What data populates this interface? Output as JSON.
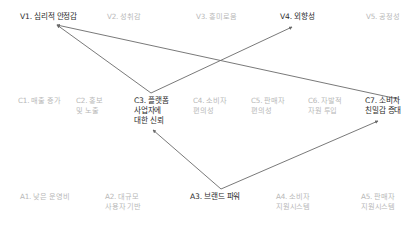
{
  "diagram": {
    "type": "means-end-ladder",
    "colors": {
      "active_text": "#2a2a2a",
      "inactive_text": "#b8b8b8",
      "edge": "#6a6a6a"
    },
    "values": [
      {
        "id": "V1",
        "label": "V1. 심리적 안정감",
        "active": true
      },
      {
        "id": "V2",
        "label": "V2. 성취감",
        "active": false
      },
      {
        "id": "V3",
        "label": "V3. 흥미로움",
        "active": false
      },
      {
        "id": "V4",
        "label": "V4. 외향성",
        "active": true
      },
      {
        "id": "V5",
        "label": "V5. 공정성",
        "active": false
      }
    ],
    "consequences": [
      {
        "id": "C1",
        "label": "C1. 매출 증가",
        "active": false
      },
      {
        "id": "C2",
        "label": "C2. 홍보\n및 노출",
        "active": false
      },
      {
        "id": "C3",
        "label": "C3. 플랫폼\n사업자에\n대한 신뢰",
        "active": true
      },
      {
        "id": "C4",
        "label": "C4. 소비자\n편의성",
        "active": false
      },
      {
        "id": "C5",
        "label": "C5. 판매자\n편의성",
        "active": false
      },
      {
        "id": "C6",
        "label": "C6. 자발적\n자원 투입",
        "active": false
      },
      {
        "id": "C7",
        "label": "C7. 소비자\n친밀감 증대",
        "active": true
      }
    ],
    "attributes": [
      {
        "id": "A1",
        "label": "A1. 낮은 운영비",
        "active": false
      },
      {
        "id": "A2",
        "label": "A2. 대규모\n사용자 기반",
        "active": false
      },
      {
        "id": "A3",
        "label": "A3. 브랜드 파워",
        "active": true
      },
      {
        "id": "A4",
        "label": "A4. 소비자\n지원시스템",
        "active": false
      },
      {
        "id": "A5",
        "label": "A5. 판매자\n지원시스템",
        "active": false
      }
    ],
    "edges": [
      {
        "from": "C3",
        "to": "V1"
      },
      {
        "from": "C3",
        "to": "V4"
      },
      {
        "from": "C7",
        "to": "V1"
      },
      {
        "from": "A3",
        "to": "C3"
      },
      {
        "from": "A3",
        "to": "C7"
      }
    ]
  }
}
